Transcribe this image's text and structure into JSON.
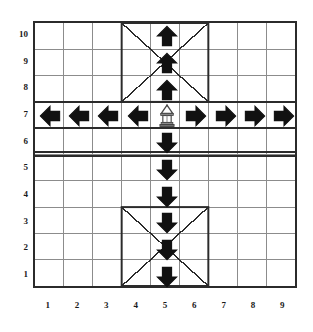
{
  "figure": {
    "title": "",
    "type": "vector-field-grid-diagram",
    "background_color": "#ffffff",
    "line_color": "#2b2b2b",
    "grid_line_color": "#8c8c8c",
    "glyph_color": "#111111"
  },
  "axes": {
    "x_label": "",
    "y_label": "",
    "x_ticks": [
      "1",
      "2",
      "3",
      "4",
      "5",
      "6",
      "7",
      "8",
      "9"
    ],
    "y_ticks": [
      "10",
      "9",
      "8",
      "7",
      "6",
      "5",
      "4",
      "3",
      "2",
      "1"
    ],
    "x_range": [
      1,
      9
    ],
    "y_range": [
      1,
      10
    ],
    "columns": 9,
    "rows": 10
  },
  "grid": {
    "border_thickness_px": 2,
    "cell_line_thickness_px": 1,
    "divider": {
      "name": "horizontal-double-divider",
      "between_rows": [
        5,
        6
      ],
      "style": "double",
      "thickness_px": 2
    },
    "boxes": [
      {
        "name": "upper-crossed-box",
        "columns": [
          4,
          6
        ],
        "rows": [
          8,
          10
        ],
        "diagonals": "x-cross",
        "thickness_px": 2
      },
      {
        "name": "lower-crossed-box",
        "columns": [
          4,
          6
        ],
        "rows": [
          1,
          3
        ],
        "diagonals": "x-cross",
        "thickness_px": 2
      }
    ]
  },
  "markers": [
    {
      "name": "source-lamp",
      "icon": "lamp-icon",
      "column": 5,
      "row": 7,
      "label": ""
    },
    {
      "name": "arrow-up-c5-r10",
      "icon": "arrow-up-icon",
      "column": 5,
      "row": 10,
      "direction": "up"
    },
    {
      "name": "arrow-up-c5-r9",
      "icon": "arrow-up-icon",
      "column": 5,
      "row": 9,
      "direction": "up"
    },
    {
      "name": "arrow-up-c5-r8",
      "icon": "arrow-up-icon",
      "column": 5,
      "row": 8,
      "direction": "up"
    },
    {
      "name": "arrow-left-c1-r7",
      "icon": "arrow-left-icon",
      "column": 1,
      "row": 7,
      "direction": "left"
    },
    {
      "name": "arrow-left-c2-r7",
      "icon": "arrow-left-icon",
      "column": 2,
      "row": 7,
      "direction": "left"
    },
    {
      "name": "arrow-left-c3-r7",
      "icon": "arrow-left-icon",
      "column": 3,
      "row": 7,
      "direction": "left"
    },
    {
      "name": "arrow-left-c4-r7",
      "icon": "arrow-left-icon",
      "column": 4,
      "row": 7,
      "direction": "left"
    },
    {
      "name": "arrow-right-c6-r7",
      "icon": "arrow-right-icon",
      "column": 6,
      "row": 7,
      "direction": "right"
    },
    {
      "name": "arrow-right-c7-r7",
      "icon": "arrow-right-icon",
      "column": 7,
      "row": 7,
      "direction": "right"
    },
    {
      "name": "arrow-right-c8-r7",
      "icon": "arrow-right-icon",
      "column": 8,
      "row": 7,
      "direction": "right"
    },
    {
      "name": "arrow-right-c9-r7",
      "icon": "arrow-right-icon",
      "column": 9,
      "row": 7,
      "direction": "right"
    },
    {
      "name": "arrow-down-c5-r6",
      "icon": "arrow-down-icon",
      "column": 5,
      "row": 6,
      "direction": "down"
    },
    {
      "name": "arrow-down-c5-r5",
      "icon": "arrow-down-icon",
      "column": 5,
      "row": 5,
      "direction": "down"
    },
    {
      "name": "arrow-down-c5-r4",
      "icon": "arrow-down-icon",
      "column": 5,
      "row": 4,
      "direction": "down"
    },
    {
      "name": "arrow-down-c5-r3",
      "icon": "arrow-down-icon",
      "column": 5,
      "row": 3,
      "direction": "down"
    },
    {
      "name": "arrow-down-c5-r2",
      "icon": "arrow-down-icon",
      "column": 5,
      "row": 2,
      "direction": "down"
    },
    {
      "name": "arrow-down-c5-r1",
      "icon": "arrow-down-icon",
      "column": 5,
      "row": 1,
      "direction": "down"
    }
  ],
  "chart_data": {
    "type": "scatter",
    "title": "",
    "xlabel": "",
    "ylabel": "",
    "xlim": [
      1,
      9
    ],
    "ylim": [
      1,
      10
    ],
    "grid": true,
    "legend": "none",
    "categories": [
      "1",
      "2",
      "3",
      "4",
      "5",
      "6",
      "7",
      "8",
      "9"
    ],
    "series": [
      {
        "name": "up-arrows",
        "symbol": "arrow-up",
        "points": [
          [
            5,
            8
          ],
          [
            5,
            9
          ],
          [
            5,
            10
          ]
        ]
      },
      {
        "name": "left-arrows",
        "symbol": "arrow-left",
        "points": [
          [
            1,
            7
          ],
          [
            2,
            7
          ],
          [
            3,
            7
          ],
          [
            4,
            7
          ]
        ]
      },
      {
        "name": "right-arrows",
        "symbol": "arrow-right",
        "points": [
          [
            6,
            7
          ],
          [
            7,
            7
          ],
          [
            8,
            7
          ],
          [
            9,
            7
          ]
        ]
      },
      {
        "name": "down-arrows",
        "symbol": "arrow-down",
        "points": [
          [
            5,
            1
          ],
          [
            5,
            2
          ],
          [
            5,
            3
          ],
          [
            5,
            4
          ],
          [
            5,
            5
          ],
          [
            5,
            6
          ]
        ]
      },
      {
        "name": "lamp-source",
        "symbol": "lamp",
        "points": [
          [
            5,
            7
          ]
        ]
      }
    ],
    "annotations": [
      {
        "type": "crossed-box",
        "x_range": [
          4,
          6
        ],
        "y_range": [
          8,
          10
        ]
      },
      {
        "type": "crossed-box",
        "x_range": [
          4,
          6
        ],
        "y_range": [
          1,
          3
        ]
      },
      {
        "type": "double-line",
        "y": 5.5,
        "orientation": "horizontal"
      }
    ]
  }
}
